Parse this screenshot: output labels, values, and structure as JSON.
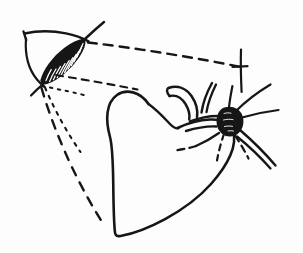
{
  "figure": {
    "medium": "pen-and-ink line drawing",
    "background_color": "#fdfdfd",
    "ink_color": "#161616",
    "canvas": {
      "width": 303,
      "height": 253
    }
  },
  "elements": {
    "eye": {
      "name": "eye-lens-shape",
      "description": "Hatched almond/lens form with upper bracket and arc, upper-left",
      "hatch_count": 11
    },
    "heart": {
      "name": "heart-outline",
      "description": "Large heart-shaped organ outline occupying lower-center"
    },
    "vessels": {
      "name": "vessel-branches",
      "description": "Curving tube-like vessels arching from heart top toward the nodule"
    },
    "nodule": {
      "name": "dark-nodule",
      "description": "Solid black rounded blob with radiating spokes at right",
      "spoke_count": 8
    },
    "sight_lines": {
      "name": "projection-lines",
      "description": "Dashed and dotted rays emanating from the eye toward the heart and nodule",
      "dashed_count": 3,
      "dotted_count": 2
    },
    "crosshair": {
      "name": "crosshair-mark",
      "description": "Vertical stroke with short crossing tick, upper right"
    }
  },
  "labels": {
    "figure_caption": "",
    "annotations": []
  },
  "colors": {
    "ink": "#161616",
    "paper": "#fdfdfd",
    "nodule_fill": "#101010"
  }
}
